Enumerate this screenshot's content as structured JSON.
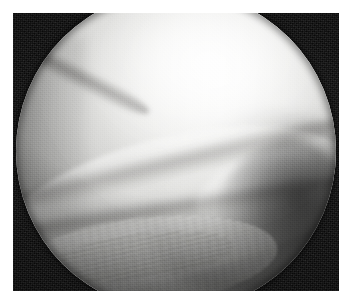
{
  "figure": {
    "kind": "arthroscopic-photograph",
    "caption": "",
    "modality": "Arthroscopy",
    "color_mode": "Grayscale",
    "width_px": 348,
    "height_px": 299
  },
  "frame": {
    "page_background": "#ffffff",
    "margin_px": 13,
    "plate_background": "#0b0b0b",
    "plate_left_px": 13,
    "plate_top_px": 13,
    "plate_width_px": 326,
    "plate_height_px": 278
  },
  "scope_field": {
    "shape": "circle",
    "label": "endoscopic field of view",
    "center_x_px": 163,
    "center_y_px": 138,
    "diameter_px": 320,
    "clipped_edges": "top and bottom",
    "rim_color": "#0b0b0b",
    "field_base_color": "#e0e0de",
    "highlight_color": "#ffffff",
    "shadow_color": "#141414"
  },
  "structures": [
    {
      "id": "femoral-condyle",
      "label": "Femoral condyle",
      "description": "Large smooth convex cartilage surface occupying the upper two thirds of the field",
      "tone": "bright",
      "tone_hex": "#f1f1f0"
    },
    {
      "id": "condyle-highlight",
      "label": "Specular highlight",
      "description": "Light reflection from the arthroscope on the condylar cartilage",
      "tone": "brightest",
      "tone_hex": "#ffffff"
    },
    {
      "id": "meniscus-body",
      "label": "Meniscus",
      "description": "Pale wedge-shaped band sweeping from lower left to mid right",
      "tone": "light-mid",
      "tone_hex": "#dedeca"
    },
    {
      "id": "meniscus-crease-upper",
      "label": "Upper meniscal seam",
      "description": "Dark crease between condyle and meniscal surface",
      "tone": "dark-line",
      "tone_hex": "#3a3836"
    },
    {
      "id": "meniscus-crease-lower",
      "label": "Lower meniscal seam",
      "description": "Second dark crease along the tibial side of the meniscus",
      "tone": "dark-line",
      "tone_hex": "#373534"
    },
    {
      "id": "lateral-fold",
      "label": "Lateral fold",
      "description": "Short oblique crease entering from the upper left",
      "tone": "dark-line",
      "tone_hex": "#3a3836"
    },
    {
      "id": "joint-recess",
      "label": "Joint recess",
      "description": "Dark unlit pocket along the right flank of the field",
      "tone": "dark",
      "tone_hex": "#222222"
    },
    {
      "id": "fibrous-tissue",
      "label": "Fibrous synovial tissue",
      "description": "Striated textured tissue across the lower left of the field",
      "tone": "mid",
      "tone_hex": "#c8c8c5"
    }
  ],
  "annotations": {
    "overlay_text": "",
    "markers": []
  }
}
